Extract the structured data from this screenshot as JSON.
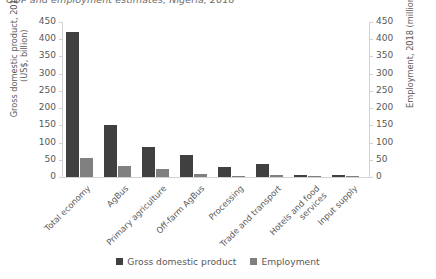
{
  "chart_data": {
    "type": "bar",
    "title": "GDP and employment estimates, Nigeria, 2018",
    "xlabel": "",
    "ylabel": "Gross domestic product, 2018\n(US$, billion)",
    "y2label": "Employment, 2018 (million)",
    "ylim": [
      0,
      450
    ],
    "y2lim": [
      0,
      450
    ],
    "yticks": [
      "450",
      "400",
      "350",
      "300",
      "250",
      "200",
      "150",
      "100",
      "50",
      "0"
    ],
    "y2ticks": [
      "450",
      "400",
      "350",
      "300",
      "250",
      "200",
      "150",
      "100",
      "50",
      "0"
    ],
    "grid": false,
    "legend_position": "bottom-center",
    "categories": [
      "Total economy",
      "AgBus",
      "Primary agriculture",
      "Off-farm AgBus",
      "Processing",
      "Trade and transport",
      "Hotels and food\nservices",
      "Input supply"
    ],
    "series": [
      {
        "name": "Gross domestic product",
        "color": "#404040",
        "axis": "left",
        "values": [
          420,
          150,
          87,
          63,
          29,
          38,
          5,
          6
        ]
      },
      {
        "name": "Employment",
        "color": "#808080",
        "axis": "right",
        "values": [
          55,
          33,
          23,
          10,
          3,
          6,
          1,
          0.5
        ]
      }
    ]
  },
  "legend": {
    "items": [
      {
        "label": "Gross domestic product",
        "color": "#404040"
      },
      {
        "label": "Employment",
        "color": "#808080"
      }
    ]
  }
}
